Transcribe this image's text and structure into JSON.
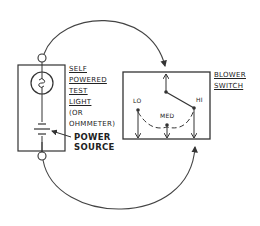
{
  "diagram": {
    "test_light": {
      "label_lines": [
        "SELF",
        "POWERED",
        "TEST",
        "LIGHT",
        "(OR",
        "OHMMETER)"
      ],
      "power_source_label_lines": [
        "POWER",
        "SOURCE"
      ]
    },
    "blower_switch": {
      "label_lines": [
        "BLOWER",
        "SWITCH"
      ],
      "positions": [
        "LO",
        "MED",
        "HI"
      ],
      "selected_position": "HI"
    },
    "colors": {
      "line": "#333333",
      "background": "#ffffff"
    }
  }
}
